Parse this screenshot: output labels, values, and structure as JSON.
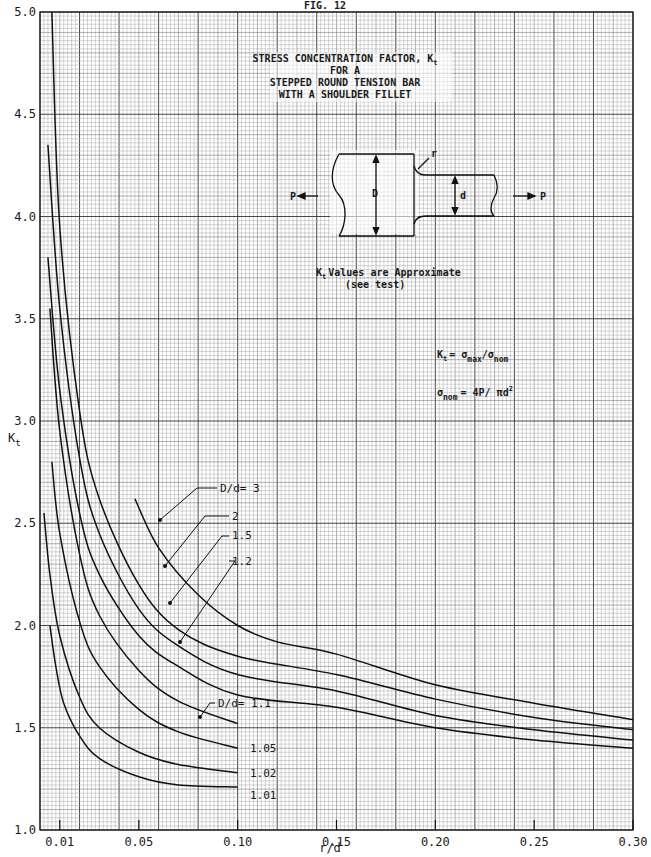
{
  "figure_label": "FIG. 12",
  "chart_data": {
    "type": "line",
    "title_lines": [
      "STRESS CONCENTRATION FACTOR, K",
      "FOR A",
      "STEPPED ROUND TENSION BAR",
      "WITH A SHOULDER FILLET"
    ],
    "title_subscript": "t",
    "xlabel": "r/d",
    "ylabel": "K",
    "ylabel_subscript": "t",
    "xlim": [
      0,
      0.3
    ],
    "ylim": [
      1.0,
      5.0
    ],
    "grid": true,
    "x_ticks": [
      {
        "value": 0.01,
        "label": "0.01"
      },
      {
        "value": 0.05,
        "label": "0.05"
      },
      {
        "value": 0.1,
        "label": "0.10"
      },
      {
        "value": 0.15,
        "label": "0.15"
      },
      {
        "value": 0.2,
        "label": "0.20"
      },
      {
        "value": 0.25,
        "label": "0.25"
      },
      {
        "value": 0.3,
        "label": "0.30"
      }
    ],
    "y_ticks": [
      {
        "value": 1.0,
        "label": "1.0"
      },
      {
        "value": 1.5,
        "label": "1.5"
      },
      {
        "value": 2.0,
        "label": "2.0"
      },
      {
        "value": 2.5,
        "label": "2.5"
      },
      {
        "value": 3.0,
        "label": "3.0"
      },
      {
        "value": 3.5,
        "label": "3.5"
      },
      {
        "value": 4.0,
        "label": "4.0"
      },
      {
        "value": 4.5,
        "label": "4.5"
      },
      {
        "value": 5.0,
        "label": "5.0"
      }
    ],
    "series": [
      {
        "name": "D/d = 3",
        "label": "D/d= 3",
        "x": [
          0.048,
          0.06,
          0.08,
          0.1,
          0.12,
          0.15,
          0.2,
          0.25,
          0.3
        ],
        "y": [
          2.62,
          2.38,
          2.15,
          2.0,
          1.92,
          1.86,
          1.71,
          1.62,
          1.54
        ]
      },
      {
        "name": "D/d = 2",
        "label": "2",
        "x": [
          0.006,
          0.01,
          0.02,
          0.03,
          0.05,
          0.07,
          0.1,
          0.15,
          0.2,
          0.25,
          0.3
        ],
        "y": [
          5.0,
          3.95,
          3.05,
          2.62,
          2.2,
          1.98,
          1.85,
          1.76,
          1.64,
          1.55,
          1.49
        ]
      },
      {
        "name": "D/d = 1.5",
        "label": "1.5",
        "x": [
          0.004,
          0.01,
          0.02,
          0.03,
          0.05,
          0.07,
          0.1,
          0.15,
          0.2,
          0.25,
          0.3
        ],
        "y": [
          4.35,
          3.55,
          2.82,
          2.45,
          2.08,
          1.9,
          1.76,
          1.68,
          1.56,
          1.49,
          1.44
        ]
      },
      {
        "name": "D/d = 1.2",
        "label": "1.2",
        "x": [
          0.004,
          0.01,
          0.02,
          0.03,
          0.05,
          0.07,
          0.1,
          0.15,
          0.2,
          0.25,
          0.3
        ],
        "y": [
          3.8,
          3.15,
          2.55,
          2.25,
          1.95,
          1.8,
          1.66,
          1.6,
          1.5,
          1.44,
          1.4
        ]
      },
      {
        "name": "D/d = 1.1",
        "label": "D/d= 1.1",
        "x": [
          0.005,
          0.01,
          0.02,
          0.03,
          0.05,
          0.07,
          0.1
        ],
        "y": [
          3.55,
          2.95,
          2.35,
          2.05,
          1.78,
          1.63,
          1.52
        ]
      },
      {
        "name": "D/d = 1.05",
        "label": "1.05",
        "x": [
          0.006,
          0.01,
          0.02,
          0.03,
          0.05,
          0.07,
          0.1
        ],
        "y": [
          2.8,
          2.45,
          2.02,
          1.8,
          1.59,
          1.48,
          1.4
        ]
      },
      {
        "name": "D/d = 1.02",
        "label": "1.02",
        "x": [
          0.002,
          0.005,
          0.01,
          0.02,
          0.03,
          0.05,
          0.07,
          0.1
        ],
        "y": [
          2.55,
          2.25,
          1.95,
          1.65,
          1.5,
          1.38,
          1.32,
          1.28
        ]
      },
      {
        "name": "D/d = 1.01",
        "label": "1.01",
        "x": [
          0.005,
          0.008,
          0.012,
          0.02,
          0.03,
          0.05,
          0.07,
          0.1
        ],
        "y": [
          2.0,
          1.8,
          1.62,
          1.46,
          1.35,
          1.26,
          1.22,
          1.21
        ]
      }
    ],
    "annotations": {
      "note_line1": "K  Values are Approximate",
      "note_sub": "t",
      "note_line2": "(see test)",
      "formula1_lhs": "K",
      "formula1_lhs_sub": "t",
      "formula1_rhs": "= σ   / σ",
      "formula1_sub_a": "max",
      "formula1_sub_b": "nom",
      "formula2_lhs": "σ",
      "formula2_lhs_sub": "nom",
      "formula2_rhs": "= 4P/ πd",
      "formula2_sup": "2"
    },
    "diagram_labels": {
      "load_left": "P",
      "load_right": "P",
      "big_diameter": "D",
      "small_diameter": "d",
      "fillet_radius": "r"
    }
  }
}
